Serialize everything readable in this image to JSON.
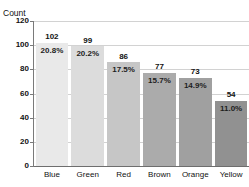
{
  "chart_data": {
    "type": "bar",
    "title": "",
    "title_clipped": true,
    "xlabel": "",
    "ylabel": "Count",
    "categories": [
      "Blue",
      "Green",
      "Red",
      "Brown",
      "Orange",
      "Yellow"
    ],
    "values": [
      102,
      99,
      86,
      77,
      73,
      54
    ],
    "percent_labels": [
      "20.8%",
      "20.2%",
      "17.5%",
      "15.7%",
      "14.9%",
      "11.0%"
    ],
    "ylim": [
      0,
      120
    ],
    "yticks": [
      0,
      20,
      40,
      60,
      80,
      100,
      120
    ],
    "ytick_labels": [
      "0",
      "20",
      "40",
      "60",
      "80",
      "100",
      "120"
    ],
    "grid": true,
    "grid_axis": "y",
    "legend": false,
    "bar_colors": [
      "#e9e9e9",
      "#dcdcdc",
      "#c6c6c6",
      "#ababab",
      "#a0a0a0",
      "#919191"
    ],
    "total": 491
  },
  "axis": {
    "y_title": "Count"
  },
  "bars": [
    {
      "category": "Blue",
      "count": "102",
      "percent": "20.8%",
      "value": 102,
      "color": "#e9e9e9"
    },
    {
      "category": "Green",
      "count": "99",
      "percent": "20.2%",
      "value": 99,
      "color": "#dcdcdc"
    },
    {
      "category": "Red",
      "count": "86",
      "percent": "17.5%",
      "value": 86,
      "color": "#c6c6c6"
    },
    {
      "category": "Brown",
      "count": "77",
      "percent": "15.7%",
      "value": 77,
      "color": "#ababab"
    },
    {
      "category": "Orange",
      "count": "73",
      "percent": "14.9%",
      "value": 73,
      "color": "#a0a0a0"
    },
    {
      "category": "Yellow",
      "count": "54",
      "percent": "11.0%",
      "value": 54,
      "color": "#919191"
    }
  ],
  "yticks": [
    {
      "label": "120",
      "value": 120
    },
    {
      "label": "100",
      "value": 100
    },
    {
      "label": "80",
      "value": 80
    },
    {
      "label": "60",
      "value": 60
    },
    {
      "label": "40",
      "value": 40
    },
    {
      "label": "20",
      "value": 20
    },
    {
      "label": "0",
      "value": 0
    }
  ]
}
